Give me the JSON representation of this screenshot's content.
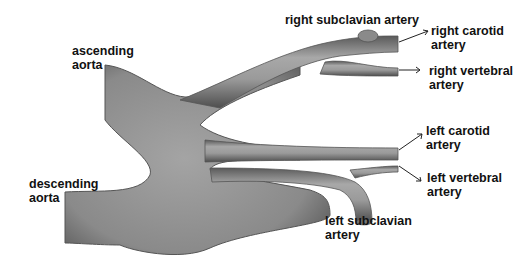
{
  "diagram": {
    "labels": {
      "ascending_aorta": [
        "ascending",
        "aorta"
      ],
      "descending_aorta": [
        "descending",
        "aorta"
      ],
      "right_subclavian": [
        "right subclavian artery"
      ],
      "right_carotid": [
        "right carotid",
        "artery"
      ],
      "right_vertebral": [
        "right vertebral",
        "artery"
      ],
      "left_carotid": [
        "left carotid",
        "artery"
      ],
      "left_vertebral": [
        "left vertebral",
        "artery"
      ],
      "left_subclavian": [
        "left subclavian",
        "artery"
      ]
    },
    "colors": {
      "vessel_mid": "#8c8c8c",
      "vessel_light": "#b4b4b4",
      "vessel_dark": "#4a4a4a",
      "text": "#111111",
      "background": "#ffffff"
    }
  }
}
